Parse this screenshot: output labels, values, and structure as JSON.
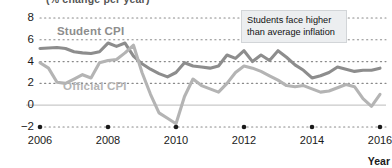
{
  "chart_data": {
    "type": "line",
    "title": "(% change per year)",
    "xlabel": "Year",
    "ylabel": "",
    "xlim": [
      2006,
      2016
    ],
    "ylim": [
      -2,
      8
    ],
    "grid": true,
    "legend_position": "inline-labels",
    "y_ticks": [
      "8",
      "6",
      "4",
      "2",
      "0",
      "−2"
    ],
    "y_tick_values": [
      8,
      6,
      4,
      2,
      0,
      -2
    ],
    "x_ticks": [
      "2006",
      "2008",
      "2010",
      "2012",
      "2014",
      "2016"
    ],
    "x_tick_values": [
      2006,
      2008,
      2010,
      2012,
      2014,
      2016
    ],
    "annotations": [
      {
        "name": "callout",
        "line1": "Students face higher",
        "line2": "than average inflation"
      }
    ],
    "series": [
      {
        "name": "Student CPI",
        "color": "#8d8d8d",
        "label_x": 2007.0,
        "label_y": 6.6,
        "x": [
          2006.0,
          2006.25,
          2006.5,
          2006.75,
          2007.0,
          2007.25,
          2007.5,
          2007.75,
          2008.0,
          2008.25,
          2008.5,
          2008.75,
          2009.0,
          2009.25,
          2009.5,
          2009.75,
          2010.0,
          2010.25,
          2010.5,
          2010.75,
          2011.0,
          2011.25,
          2011.5,
          2011.75,
          2012.0,
          2012.25,
          2012.5,
          2012.75,
          2013.0,
          2013.25,
          2013.5,
          2013.75,
          2014.0,
          2014.25,
          2014.5,
          2014.75,
          2015.0,
          2015.25,
          2015.5,
          2015.75,
          2016.0
        ],
        "values": [
          5.2,
          5.25,
          5.3,
          5.2,
          4.9,
          4.8,
          4.75,
          4.9,
          5.7,
          5.4,
          5.7,
          4.5,
          3.8,
          3.3,
          2.9,
          2.6,
          3.0,
          3.9,
          3.6,
          3.5,
          3.4,
          3.6,
          4.6,
          4.3,
          5.0,
          4.0,
          4.6,
          4.1,
          5.0,
          4.4,
          3.7,
          3.2,
          2.5,
          2.7,
          3.0,
          3.5,
          3.3,
          3.1,
          3.2,
          3.2,
          3.4
        ]
      },
      {
        "name": "Official CPI",
        "color": "#b4b4b4",
        "label_x": 2007.2,
        "label_y": 1.5,
        "x": [
          2006.0,
          2006.25,
          2006.5,
          2006.75,
          2007.0,
          2007.25,
          2007.5,
          2007.75,
          2008.0,
          2008.25,
          2008.5,
          2008.75,
          2009.0,
          2009.25,
          2009.5,
          2009.75,
          2010.0,
          2010.25,
          2010.5,
          2010.75,
          2011.0,
          2011.25,
          2011.5,
          2011.75,
          2012.0,
          2012.25,
          2012.5,
          2012.75,
          2013.0,
          2013.25,
          2013.5,
          2013.75,
          2014.0,
          2014.25,
          2014.5,
          2014.75,
          2015.0,
          2015.25,
          2015.5,
          2015.75,
          2016.0
        ],
        "values": [
          3.9,
          3.4,
          2.1,
          2.0,
          2.4,
          2.8,
          2.5,
          3.9,
          4.1,
          4.2,
          4.8,
          5.5,
          3.0,
          1.0,
          -0.7,
          -1.2,
          -1.7,
          0.8,
          2.4,
          1.8,
          1.5,
          1.2,
          2.0,
          3.0,
          3.6,
          3.4,
          3.1,
          2.7,
          2.3,
          1.8,
          1.7,
          1.8,
          1.5,
          1.2,
          1.3,
          1.6,
          1.9,
          1.7,
          0.6,
          -0.1,
          1.0
        ]
      }
    ]
  }
}
